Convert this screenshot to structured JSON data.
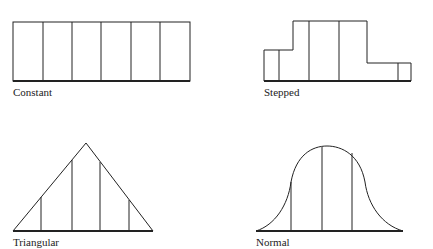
{
  "diagrams": [
    {
      "name": "constant",
      "label": "Constant",
      "segments": 6
    },
    {
      "name": "stepped",
      "label": "Stepped",
      "segments": 6
    },
    {
      "name": "triangular",
      "label": "Triangular",
      "segments": 5
    },
    {
      "name": "normal",
      "label": "Normal",
      "segments": 4
    }
  ],
  "colors": {
    "stroke": "#222222",
    "background": "#ffffff"
  }
}
